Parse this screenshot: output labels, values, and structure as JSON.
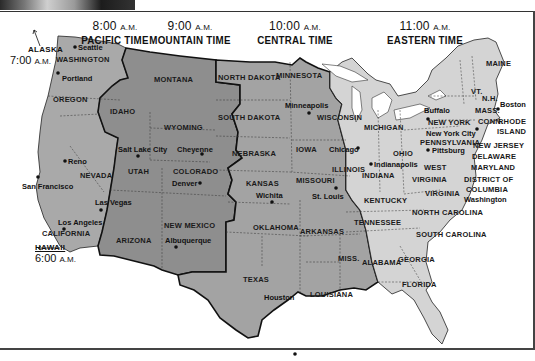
{
  "map": {
    "title_zones": [
      {
        "id": "pacific",
        "time": "8:00",
        "ampm": "A.M.",
        "name": "PACIFIC TIME"
      },
      {
        "id": "mountain",
        "time": "9:00",
        "ampm": "A.M.",
        "name": "MOUNTAIN TIME"
      },
      {
        "id": "central",
        "time": "10:00",
        "ampm": "A.M.",
        "name": "CENTRAL TIME"
      },
      {
        "id": "eastern",
        "time": "11:00",
        "ampm": "A.M.",
        "name": "EASTERN TIME"
      }
    ],
    "outliers": {
      "alaska": {
        "name": "ALASKA",
        "time": "7:00",
        "ampm": "A.M."
      },
      "hawaii": {
        "name": "HAWAII",
        "time": "6:00",
        "ampm": "A.M."
      }
    },
    "zone_colors": {
      "pacific": "#a9a9a9",
      "mountain": "#8e8e8e",
      "central": "#a3a3a3",
      "eastern": "#d4d4d4"
    },
    "states": [
      "WASHINGTON",
      "OREGON",
      "CALIFORNIA",
      "NEVADA",
      "IDAHO",
      "MONTANA",
      "WYOMING",
      "UTAH",
      "COLORADO",
      "ARIZONA",
      "NEW MEXICO",
      "NORTH DAKOTA",
      "SOUTH DAKOTA",
      "NEBRASKA",
      "KANSAS",
      "OKLAHOMA",
      "TEXAS",
      "MINNESOTA",
      "IOWA",
      "MISSOURI",
      "ARKANSAS",
      "LOUISIANA",
      "WISCONSIN",
      "ILLINOIS",
      "MISS.",
      "ALABAMA",
      "TENNESSEE",
      "KENTUCKY",
      "INDIANA",
      "MICHIGAN",
      "OHIO",
      "WEST",
      "VIRGINIA",
      "VIRGINIA",
      "NORTH CAROLINA",
      "SOUTH CAROLINA",
      "GEORGIA",
      "FLORIDA",
      "PENNSYLVANIA",
      "NEW YORK",
      "MAINE",
      "VT.",
      "N.H.",
      "MASS.",
      "CONN.",
      "RHODE",
      "ISLAND",
      "NEW JERSEY",
      "DELAWARE",
      "MARYLAND",
      "DISTRICT OF",
      "COLUMBIA"
    ],
    "cities": [
      "Seattle",
      "Portland",
      "Reno",
      "San Francisco",
      "Los Angeles",
      "Las Vegas",
      "Salt Lake City",
      "Cheyenne",
      "Denver",
      "Albuquerque",
      "Minneapolis",
      "Chicago",
      "Wichita",
      "St. Louis",
      "Houston",
      "Indianapolis",
      "Pittsburg",
      "Buffalo",
      "New York City",
      "Boston",
      "Washington"
    ]
  }
}
